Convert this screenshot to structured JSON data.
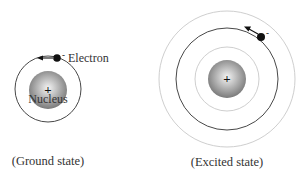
{
  "diagram": {
    "ground": {
      "caption": "(Ground state)",
      "electron_label": "Electron",
      "nucleus_label": "Nucleus",
      "nucleus_charge": "+",
      "electron_charge": "-"
    },
    "excited": {
      "caption": "(Excited state)",
      "nucleus_charge": "+",
      "electron_charge": "-"
    }
  }
}
